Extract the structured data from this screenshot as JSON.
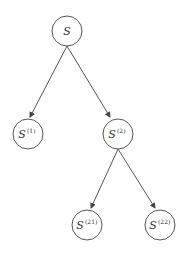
{
  "diagram": {
    "type": "tree",
    "colors": {
      "stroke": "#555555",
      "text": "#333333",
      "background": "#ffffff"
    },
    "nodes": [
      {
        "id": "S",
        "base": "S",
        "sup": "",
        "cx": 67,
        "cy": 31
      },
      {
        "id": "S1",
        "base": "S",
        "sup": "(1)",
        "cx": 28,
        "cy": 134
      },
      {
        "id": "S2",
        "base": "S",
        "sup": "(2)",
        "cx": 118,
        "cy": 134
      },
      {
        "id": "S21",
        "base": "S",
        "sup": "(21)",
        "cx": 87,
        "cy": 225
      },
      {
        "id": "S22",
        "base": "S",
        "sup": "(22)",
        "cx": 160,
        "cy": 225
      }
    ],
    "edges": [
      {
        "from": "S",
        "to": "S1"
      },
      {
        "from": "S",
        "to": "S2"
      },
      {
        "from": "S2",
        "to": "S21"
      },
      {
        "from": "S2",
        "to": "S22"
      }
    ]
  }
}
